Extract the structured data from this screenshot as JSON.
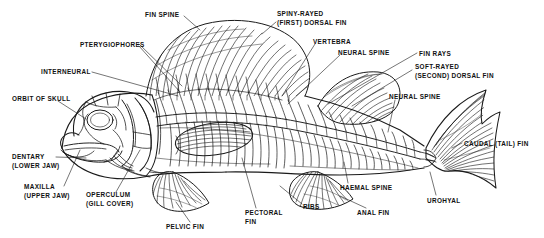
{
  "diagram": {
    "background_color": "#ffffff",
    "ink_color": "#1a1a1a",
    "labels": [
      {
        "id": "fin-spine",
        "text": "FIN SPINE",
        "x": 145,
        "y": 11,
        "align": "left"
      },
      {
        "id": "spiny-rayed-dorsal",
        "text": "SPINY-RAYED\n(FIRST) DORSAL FIN",
        "x": 277,
        "y": 10,
        "align": "left"
      },
      {
        "id": "pterygiophores",
        "text": "PTERYGIOPHORES",
        "x": 80,
        "y": 41,
        "align": "left"
      },
      {
        "id": "vertebra",
        "text": "VERTEBRA",
        "x": 313,
        "y": 38,
        "align": "left"
      },
      {
        "id": "neural-spine-upper",
        "text": "NEURAL SPINE",
        "x": 338,
        "y": 49,
        "align": "left"
      },
      {
        "id": "fin-rays",
        "text": "FIN RAYS",
        "x": 419,
        "y": 50,
        "align": "left"
      },
      {
        "id": "interneural",
        "text": "INTERNEURAL",
        "x": 41,
        "y": 68,
        "align": "left"
      },
      {
        "id": "soft-rayed-dorsal",
        "text": "SOFT-RAYED\n(SECOND) DORSAL FIN",
        "x": 415,
        "y": 63,
        "align": "left"
      },
      {
        "id": "orbit-of-skull",
        "text": "ORBIT OF SKULL",
        "x": 12,
        "y": 95,
        "align": "left"
      },
      {
        "id": "neural-spine-lower",
        "text": "NEURAL SPINE",
        "x": 389,
        "y": 93,
        "align": "left"
      },
      {
        "id": "caudal-tail-fin",
        "text": "CAUDAL (TAIL) FIN",
        "x": 464,
        "y": 140,
        "align": "left"
      },
      {
        "id": "dentary",
        "text": "DENTARY\n(LOWER JAW)",
        "x": 12,
        "y": 153,
        "align": "left"
      },
      {
        "id": "maxilla",
        "text": "MAXILLA\n(UPPER JAW)",
        "x": 24,
        "y": 183,
        "align": "left"
      },
      {
        "id": "operculum",
        "text": "OPERCULUM\n(GILL COVER)",
        "x": 86,
        "y": 191,
        "align": "left"
      },
      {
        "id": "haemal-spine",
        "text": "HAEMAL SPINE",
        "x": 340,
        "y": 184,
        "align": "left"
      },
      {
        "id": "urohyal",
        "text": "UROHYAL",
        "x": 427,
        "y": 197,
        "align": "left"
      },
      {
        "id": "ribs",
        "text": "RIBS",
        "x": 303,
        "y": 203,
        "align": "left"
      },
      {
        "id": "pectoral-fin",
        "text": "PECTORAL\nFIN",
        "x": 245,
        "y": 209,
        "align": "left"
      },
      {
        "id": "anal-fin",
        "text": "ANAL FIN",
        "x": 357,
        "y": 209,
        "align": "left"
      },
      {
        "id": "pelvic-fin",
        "text": "PELVIC FIN",
        "x": 166,
        "y": 223,
        "align": "left"
      }
    ]
  }
}
